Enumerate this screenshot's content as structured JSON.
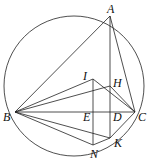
{
  "diagram": {
    "type": "geometry",
    "circle": {
      "cx": 74,
      "cy": 86,
      "r": 70
    },
    "points": {
      "A": {
        "x": 110,
        "y": 16,
        "lx": 107,
        "ly": 13
      },
      "B": {
        "x": 15,
        "y": 112,
        "lx": 3,
        "ly": 121
      },
      "C": {
        "x": 135,
        "y": 112,
        "lx": 138,
        "ly": 121
      },
      "I": {
        "x": 93,
        "y": 79,
        "lx": 83,
        "ly": 80
      },
      "H": {
        "x": 110,
        "y": 86,
        "lx": 113,
        "ly": 87
      },
      "E": {
        "x": 93,
        "y": 112,
        "lx": 83,
        "ly": 121
      },
      "D": {
        "x": 110,
        "y": 112,
        "lx": 113,
        "ly": 121
      },
      "K": {
        "x": 110,
        "y": 138,
        "lx": 114,
        "ly": 147
      },
      "N": {
        "x": 93,
        "y": 145,
        "lx": 90,
        "ly": 158
      }
    },
    "labels": {
      "A": "A",
      "B": "B",
      "C": "C",
      "I": "I",
      "H": "H",
      "E": "E",
      "D": "D",
      "K": "K",
      "N": "N"
    },
    "segments": [
      [
        "A",
        "B"
      ],
      [
        "A",
        "C"
      ],
      [
        "A",
        "K"
      ],
      [
        "B",
        "C"
      ],
      [
        "B",
        "I"
      ],
      [
        "B",
        "H"
      ],
      [
        "B",
        "N"
      ],
      [
        "B",
        "K"
      ],
      [
        "I",
        "N"
      ],
      [
        "I",
        "C"
      ],
      [
        "H",
        "C"
      ],
      [
        "C",
        "K"
      ],
      [
        "N",
        "K"
      ]
    ]
  }
}
